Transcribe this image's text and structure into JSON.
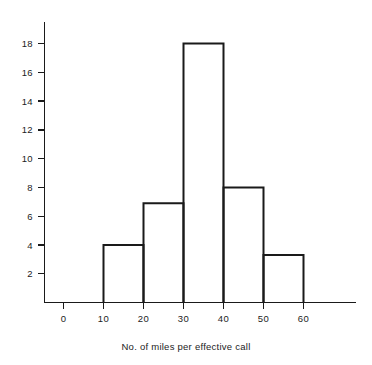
{
  "chart_data": {
    "type": "bar",
    "title": "",
    "subtitle": "",
    "xlabel": "No. of miles per effective call",
    "ylabel": "",
    "categories": [
      "0-10",
      "10-20",
      "20-30",
      "30-40",
      "40-50",
      "50-60"
    ],
    "bin_edges": [
      0,
      10,
      20,
      30,
      40,
      50,
      60
    ],
    "values": [
      0,
      4,
      6.9,
      18,
      8,
      3.3
    ],
    "bars": [
      {
        "from": 10,
        "to": 20,
        "value": 4
      },
      {
        "from": 20,
        "to": 30,
        "value": 6.9
      },
      {
        "from": 30,
        "to": 40,
        "value": 18
      },
      {
        "from": 40,
        "to": 50,
        "value": 8
      },
      {
        "from": 50,
        "to": 60,
        "value": 3.3
      }
    ],
    "xlim": [
      0,
      65
    ],
    "ylim": [
      0,
      19.5
    ],
    "xticks": [
      0,
      10,
      20,
      30,
      40,
      50,
      60
    ],
    "xtick_labels": [
      "0",
      "10",
      "20",
      "30",
      "40",
      "50",
      "60"
    ],
    "yticks": [
      2,
      4,
      6,
      8,
      10,
      12,
      14,
      16,
      18
    ],
    "ytick_labels": [
      "2",
      "4",
      "6",
      "8",
      "10",
      "12",
      "14",
      "16",
      "18"
    ],
    "grid": false,
    "legend": null,
    "legend_position": "none",
    "line_color": "#1a1a1a",
    "fill_color": "#ffffff",
    "background_color": "#ffffff"
  }
}
